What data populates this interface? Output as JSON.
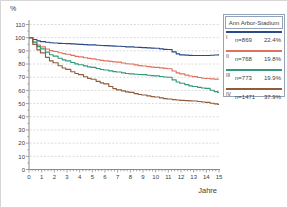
{
  "legend": {
    "title": "Ann Arbor-Stadium"
  },
  "colors": {
    "grid": "#cccccc",
    "axis": "#8c8c8c",
    "tick_text": "#3c3c3c",
    "legend_border": "#92a2b8",
    "background": "#ffffff"
  },
  "chart_data": {
    "type": "line",
    "subtype": "kaplan-meier-survival-steps",
    "title": "",
    "xlabel": "Jahre",
    "ylabel": "%",
    "x": [
      0,
      1,
      2,
      3,
      4,
      5,
      6,
      7,
      8,
      9,
      10,
      11,
      12,
      13,
      14,
      15
    ],
    "xlim": [
      0,
      15
    ],
    "ylim": [
      0,
      110
    ],
    "yticks": [
      0,
      10,
      20,
      30,
      40,
      50,
      60,
      70,
      80,
      90,
      100,
      110
    ],
    "grid": true,
    "legend_position": "outside-top-right",
    "legend_title": "Ann Arbor-Stadium",
    "series": [
      {
        "name": "I",
        "roman": "I",
        "n_label": "n=869",
        "pct_label": "22.4%",
        "color": "#2b4a87",
        "values": [
          100,
          97,
          96,
          95.5,
          95,
          94.5,
          94,
          93.5,
          93,
          92.5,
          92,
          91,
          87,
          86.5,
          86.5,
          87
        ]
      },
      {
        "name": "II",
        "roman": "II",
        "n_label": "n=768",
        "pct_label": "19.8%",
        "color": "#e0735f",
        "values": [
          100,
          93,
          89.5,
          87.5,
          85.5,
          84,
          82.5,
          81.5,
          80,
          78.5,
          77.5,
          76.5,
          72.5,
          70.5,
          69,
          68.5
        ]
      },
      {
        "name": "III",
        "roman": "III",
        "n_label": "n=773",
        "pct_label": "19.9%",
        "color": "#33997b",
        "values": [
          100,
          91.5,
          86,
          82.5,
          79.5,
          77.5,
          75.5,
          74,
          72.5,
          72,
          71,
          70,
          65.5,
          63,
          61.5,
          58.5
        ]
      },
      {
        "name": "IV",
        "roman": "IV",
        "n_label": "n=1471",
        "pct_label": "37.9%",
        "color": "#8f5c3c",
        "values": [
          100,
          88.5,
          81,
          76,
          72,
          68.5,
          65,
          60.5,
          58.5,
          56.5,
          55,
          53.5,
          52.5,
          52,
          51,
          49.5
        ]
      }
    ]
  }
}
